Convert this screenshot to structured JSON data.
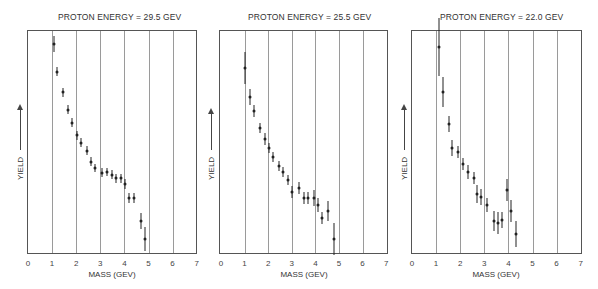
{
  "chart_data": [
    {
      "type": "scatter",
      "title": "PROTON ENERGY = 29.5 GEV",
      "xlabel": "MASS (GEV)",
      "ylabel": "YIELD",
      "xlim": [
        0,
        7
      ],
      "ylim": [
        0,
        100
      ],
      "x_ticks": [
        "0",
        "1",
        "2",
        "3",
        "4",
        "5",
        "6",
        "7"
      ],
      "grid": "vertical",
      "error_bars": true,
      "points": [
        {
          "x": 1.08,
          "y": 93.8,
          "err": 3.6
        },
        {
          "x": 1.2,
          "y": 81.3,
          "err": 2.0
        },
        {
          "x": 1.45,
          "y": 72.3,
          "err": 2.0
        },
        {
          "x": 1.66,
          "y": 64.3,
          "err": 2.0
        },
        {
          "x": 1.83,
          "y": 58.5,
          "err": 2.0
        },
        {
          "x": 2.03,
          "y": 53.1,
          "err": 2.0
        },
        {
          "x": 2.2,
          "y": 49.6,
          "err": 2.0
        },
        {
          "x": 2.45,
          "y": 46.0,
          "err": 2.0
        },
        {
          "x": 2.61,
          "y": 41.1,
          "err": 2.0
        },
        {
          "x": 2.78,
          "y": 38.4,
          "err": 2.0
        },
        {
          "x": 3.07,
          "y": 36.2,
          "err": 2.0
        },
        {
          "x": 3.28,
          "y": 36.6,
          "err": 2.0
        },
        {
          "x": 3.49,
          "y": 35.3,
          "err": 2.0
        },
        {
          "x": 3.65,
          "y": 33.9,
          "err": 2.0
        },
        {
          "x": 3.86,
          "y": 33.9,
          "err": 2.0
        },
        {
          "x": 4.02,
          "y": 31.3,
          "err": 2.4
        },
        {
          "x": 4.19,
          "y": 25.0,
          "err": 2.4
        },
        {
          "x": 4.4,
          "y": 25.0,
          "err": 2.4
        },
        {
          "x": 4.69,
          "y": 14.7,
          "err": 3.6
        },
        {
          "x": 4.85,
          "y": 6.7,
          "err": 5.4
        }
      ]
    },
    {
      "type": "scatter",
      "title": "PROTON ENERGY = 25.5 GEV",
      "xlabel": "MASS (GEV)",
      "ylabel": "YIELD",
      "xlim": [
        0,
        7
      ],
      "ylim": [
        0,
        100
      ],
      "x_ticks": [
        "0",
        "1",
        "2",
        "3",
        "4",
        "5",
        "6",
        "7"
      ],
      "grid": "vertical",
      "error_bars": true,
      "points": [
        {
          "x": 1.02,
          "y": 83.0,
          "err": 7.1
        },
        {
          "x": 1.23,
          "y": 70.1,
          "err": 3.6
        },
        {
          "x": 1.4,
          "y": 63.8,
          "err": 2.7
        },
        {
          "x": 1.66,
          "y": 56.3,
          "err": 2.2
        },
        {
          "x": 1.87,
          "y": 51.3,
          "err": 2.7
        },
        {
          "x": 2.04,
          "y": 47.3,
          "err": 2.2
        },
        {
          "x": 2.21,
          "y": 43.3,
          "err": 2.2
        },
        {
          "x": 2.47,
          "y": 39.3,
          "err": 2.2
        },
        {
          "x": 2.64,
          "y": 36.6,
          "err": 2.2
        },
        {
          "x": 2.85,
          "y": 33.0,
          "err": 2.2
        },
        {
          "x": 3.02,
          "y": 27.7,
          "err": 2.7
        },
        {
          "x": 3.32,
          "y": 29.5,
          "err": 2.7
        },
        {
          "x": 3.53,
          "y": 25.0,
          "err": 2.7
        },
        {
          "x": 3.7,
          "y": 25.0,
          "err": 2.7
        },
        {
          "x": 3.96,
          "y": 25.0,
          "err": 3.6
        },
        {
          "x": 4.09,
          "y": 21.9,
          "err": 3.1
        },
        {
          "x": 4.3,
          "y": 16.1,
          "err": 2.7
        },
        {
          "x": 4.55,
          "y": 19.2,
          "err": 4.5
        },
        {
          "x": 4.77,
          "y": 6.7,
          "err": 7.1
        }
      ]
    },
    {
      "type": "scatter",
      "title": "PROTON ENERGY = 22.0 GEV",
      "xlabel": "MASS (GEV)",
      "ylabel": "YIELD",
      "xlim": [
        0,
        7
      ],
      "ylim": [
        0,
        100
      ],
      "x_ticks": [
        "0",
        "1",
        "2",
        "3",
        "4",
        "5",
        "6",
        "7"
      ],
      "grid": "vertical",
      "error_bars": true,
      "points": [
        {
          "x": 1.12,
          "y": 92.4,
          "err": 12.9
        },
        {
          "x": 1.28,
          "y": 72.3,
          "err": 6.7
        },
        {
          "x": 1.53,
          "y": 58.0,
          "err": 3.6
        },
        {
          "x": 1.66,
          "y": 47.3,
          "err": 3.6
        },
        {
          "x": 1.91,
          "y": 45.5,
          "err": 2.7
        },
        {
          "x": 2.12,
          "y": 40.2,
          "err": 2.7
        },
        {
          "x": 2.32,
          "y": 36.6,
          "err": 3.1
        },
        {
          "x": 2.57,
          "y": 33.9,
          "err": 2.7
        },
        {
          "x": 2.7,
          "y": 26.8,
          "err": 4.0
        },
        {
          "x": 2.86,
          "y": 25.4,
          "err": 3.6
        },
        {
          "x": 3.11,
          "y": 21.9,
          "err": 3.1
        },
        {
          "x": 3.4,
          "y": 14.7,
          "err": 4.5
        },
        {
          "x": 3.57,
          "y": 13.8,
          "err": 4.9
        },
        {
          "x": 3.73,
          "y": 15.2,
          "err": 3.6
        },
        {
          "x": 3.94,
          "y": 28.6,
          "err": 4.9
        },
        {
          "x": 4.11,
          "y": 19.2,
          "err": 4.9
        },
        {
          "x": 4.32,
          "y": 8.9,
          "err": 5.8
        }
      ]
    }
  ],
  "panels": [
    {
      "title": "PROTON ENERGY = 29.5 GEV",
      "xlabel": "MASS (GEV)",
      "ylabel": "YIELD"
    },
    {
      "title": "PROTON ENERGY = 25.5 GEV",
      "xlabel": "MASS (GEV)",
      "ylabel": "YIELD"
    },
    {
      "title": "PROTON ENERGY = 22.0 GEV",
      "xlabel": "MASS (GEV)",
      "ylabel": "YIELD"
    }
  ],
  "colors": {
    "ink": "#222222",
    "grid": "#9a9a9a",
    "background": "#ffffff"
  }
}
